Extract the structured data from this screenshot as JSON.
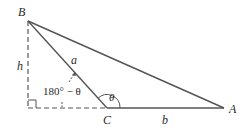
{
  "diagram": {
    "type": "triangle-geometry",
    "vertices": {
      "A": {
        "label": "A",
        "x": 224,
        "y": 108
      },
      "B": {
        "label": "B",
        "x": 28,
        "y": 21
      },
      "C": {
        "label": "C",
        "x": 107,
        "y": 108
      }
    },
    "sides": {
      "a": {
        "label": "a",
        "from": "B",
        "to": "C"
      },
      "b": {
        "label": "b",
        "from": "C",
        "to": "A"
      },
      "c": {
        "from": "B",
        "to": "A"
      }
    },
    "height": {
      "label": "h",
      "style": "dashed"
    },
    "extension": {
      "style": "dashed",
      "description": "extension of AC beyond C to foot of altitude"
    },
    "right_angle_marker": true,
    "angles": {
      "theta": {
        "label": "θ",
        "at": "C"
      },
      "exterior": {
        "label": "180° − θ",
        "at": "C"
      }
    },
    "colors": {
      "stroke": "#555555",
      "text": "#2a2a2a"
    }
  }
}
